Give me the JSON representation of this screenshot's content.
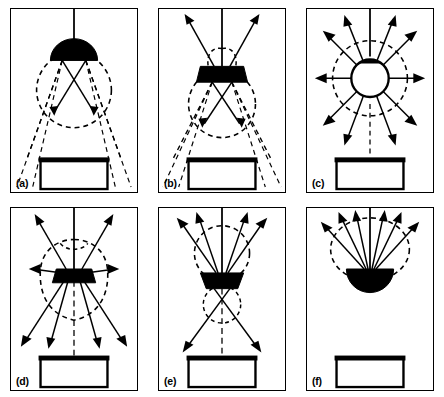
{
  "figure": {
    "background": "#ffffff",
    "stroke_color": "#000000",
    "fill_color": "#000000",
    "panel_count": 6,
    "columns": 3,
    "rows": 2
  },
  "panels": [
    {
      "id": "a",
      "label": "(a)",
      "distribution": "direct",
      "fixture_shape": "filled-dome-down",
      "has_stem": true,
      "stem_to": "ceiling",
      "lobes": [
        {
          "position": "below",
          "shape": "circle",
          "size": "large"
        }
      ],
      "arrow_count": 2,
      "arrow_direction": "down",
      "dashed_rays_to_table": true,
      "table": {
        "present": true,
        "top_bar": true
      }
    },
    {
      "id": "b",
      "label": "(b)",
      "distribution": "semi-direct",
      "fixture_shape": "filled-trapezoid-wide",
      "has_stem": true,
      "stem_to": "ceiling",
      "lobes": [
        {
          "position": "above",
          "shape": "small-twin-lobes",
          "size": "small"
        },
        {
          "position": "below",
          "shape": "circle",
          "size": "large"
        }
      ],
      "arrow_count": 4,
      "arrow_direction": "up-and-down",
      "dashed_rays_to_table": true,
      "table": {
        "present": true,
        "top_bar": true
      }
    },
    {
      "id": "c",
      "label": "(c)",
      "distribution": "general-diffuse",
      "fixture_shape": "open-globe",
      "has_stem": true,
      "stem_to": "ceiling",
      "lobes": [
        {
          "position": "around",
          "shape": "circle",
          "size": "large"
        }
      ],
      "arrow_count": 12,
      "arrow_direction": "radial",
      "dashed_rays_to_table": false,
      "table": {
        "present": true,
        "top_bar": true
      }
    },
    {
      "id": "d",
      "label": "(d)",
      "distribution": "direct-indirect",
      "fixture_shape": "filled-flat-slab",
      "has_stem": true,
      "stem_to": "ceiling",
      "lobes": [
        {
          "position": "around",
          "shape": "peanut",
          "size": "large"
        }
      ],
      "arrow_count": 8,
      "arrow_direction": "radial",
      "dashed_rays_to_table": false,
      "table": {
        "present": true,
        "top_bar": true
      }
    },
    {
      "id": "e",
      "label": "(e)",
      "distribution": "semi-indirect",
      "fixture_shape": "filled-bowl-up",
      "has_stem": true,
      "stem_to": "ceiling",
      "lobes": [
        {
          "position": "above",
          "shape": "circle",
          "size": "large"
        },
        {
          "position": "below",
          "shape": "circle",
          "size": "small"
        }
      ],
      "arrow_count": 6,
      "arrow_direction": "up-and-down",
      "dashed_rays_to_table": false,
      "table": {
        "present": true,
        "top_bar": true
      }
    },
    {
      "id": "f",
      "label": "(f)",
      "distribution": "indirect",
      "fixture_shape": "filled-half-disc-up",
      "has_stem": true,
      "stem_to": "ceiling",
      "lobes": [
        {
          "position": "above",
          "shape": "ellipse",
          "size": "large"
        }
      ],
      "arrow_count": 6,
      "arrow_direction": "up",
      "dashed_rays_to_table": false,
      "table": {
        "present": true,
        "top_bar": true
      }
    }
  ]
}
